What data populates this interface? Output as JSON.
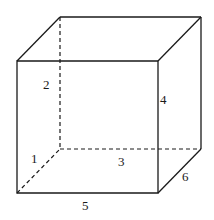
{
  "diagram": {
    "type": "cube-wireframe",
    "edge_labels": {
      "hidden_bottom_left_depth": "1",
      "hidden_back_vertical": "2",
      "hidden_back_bottom": "3",
      "front_right_vertical": "4",
      "front_bottom": "5",
      "bottom_right_depth": "6"
    },
    "colors": {
      "line": "#1a1a1a",
      "background": "#ffffff"
    }
  }
}
